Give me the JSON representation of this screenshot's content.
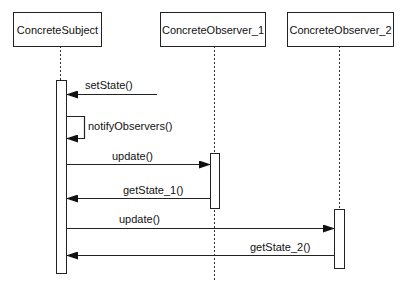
{
  "diagram": {
    "type": "sequence",
    "participants": [
      {
        "name": "ConcreteSubject"
      },
      {
        "name": "ConcreteObserver_1"
      },
      {
        "name": "ConcreteObserver_2"
      }
    ],
    "messages": [
      {
        "label": "setState()",
        "from": "external",
        "to": "ConcreteSubject"
      },
      {
        "label": "notifyObservers()",
        "from": "ConcreteSubject",
        "to": "ConcreteSubject"
      },
      {
        "label": "update()",
        "from": "ConcreteSubject",
        "to": "ConcreteObserver_1"
      },
      {
        "label": "getState_1()",
        "from": "ConcreteObserver_1",
        "to": "ConcreteSubject"
      },
      {
        "label": "update()",
        "from": "ConcreteSubject",
        "to": "ConcreteObserver_2"
      },
      {
        "label": "getState_2()",
        "from": "ConcreteObserver_2",
        "to": "ConcreteSubject"
      }
    ]
  }
}
